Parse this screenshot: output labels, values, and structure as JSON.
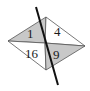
{
  "diagram": {
    "type": "quadrilateral-split-by-diagonals-with-line",
    "colors": {
      "background": "#ffffff",
      "shaded": "#c8c8c8",
      "unshaded": "#ffffff",
      "stroke": "#555555",
      "cut_line": "#111111"
    },
    "vertices": {
      "left": [
        8,
        41
      ],
      "top": [
        46,
        17
      ],
      "right": [
        85,
        46
      ],
      "bottom": [
        46,
        70
      ],
      "center": [
        45,
        43
      ]
    },
    "cut_line": {
      "from": [
        36,
        7
      ],
      "to": [
        58,
        85
      ]
    },
    "regions": [
      {
        "name": "top-left",
        "label": "1",
        "shaded": true
      },
      {
        "name": "top-right",
        "label": "4",
        "shaded": false
      },
      {
        "name": "bottom-left",
        "label": "16",
        "shaded": false
      },
      {
        "name": "bottom-right",
        "label": "9",
        "shaded": true
      }
    ]
  }
}
